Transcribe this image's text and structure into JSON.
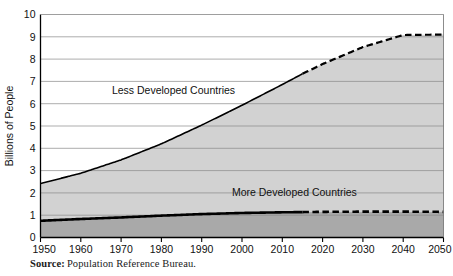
{
  "figure": {
    "source_label": "Source:",
    "source_text": "Population Reference Bureau."
  },
  "chart_data": {
    "type": "area",
    "stacked": true,
    "title": "",
    "subtitle": "",
    "xlabel": "",
    "ylabel": "Billions of People",
    "xlim": [
      1950,
      2050
    ],
    "ylim": [
      0,
      10
    ],
    "grid": true,
    "grid_axis": "y",
    "legend": "inline-annotations",
    "x": [
      1950,
      1960,
      1970,
      1980,
      1990,
      2000,
      2010,
      2015,
      2020,
      2030,
      2040,
      2050
    ],
    "xticks": [
      "1950",
      "1960",
      "1970",
      "1980",
      "1990",
      "2000",
      "2010",
      "2020",
      "2030",
      "2040",
      "2050"
    ],
    "yticks": [
      "0",
      "1",
      "2",
      "3",
      "4",
      "5",
      "6",
      "7",
      "8",
      "9",
      "10"
    ],
    "projection_start_year": 2015,
    "series": [
      {
        "name": "More Developed Countries",
        "values": [
          0.75,
          0.83,
          0.9,
          0.98,
          1.05,
          1.1,
          1.13,
          1.14,
          1.15,
          1.16,
          1.16,
          1.15
        ],
        "fill_color": "#a9a9a9",
        "line_color": "#000000"
      },
      {
        "name": "Less Developed Countries",
        "values": [
          1.67,
          2.05,
          2.58,
          3.22,
          3.99,
          4.83,
          5.73,
          6.2,
          6.63,
          7.38,
          7.92,
          7.95
        ],
        "fill_color": "#d2d2d2",
        "line_color": "#000000"
      }
    ],
    "totals": [
      2.42,
      2.88,
      3.48,
      4.2,
      5.04,
      5.93,
      6.86,
      7.34,
      7.78,
      8.54,
      9.08,
      9.1
    ],
    "annotations": [
      {
        "text": "Less Developed Countries",
        "x": 1983,
        "y": 6.45
      },
      {
        "text": "More Developed Countries",
        "x": 2013,
        "y": 1.85
      }
    ]
  }
}
